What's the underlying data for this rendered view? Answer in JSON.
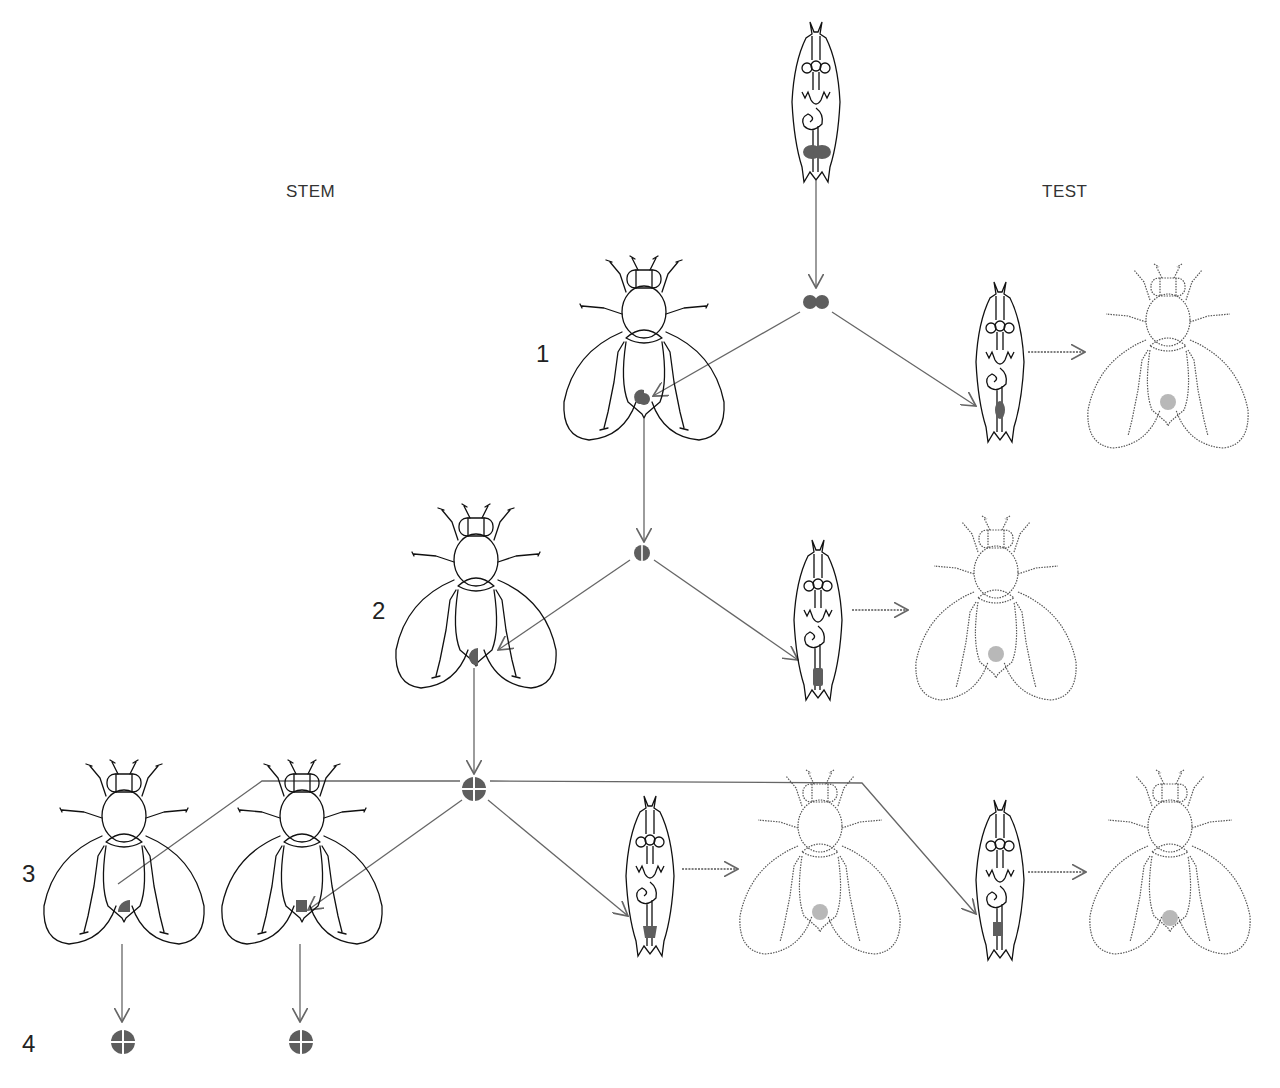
{
  "diagram": {
    "title": "",
    "type": "cell lineage / clonal analysis diagram",
    "column_labels": {
      "stem": "STEM",
      "test": "TEST"
    },
    "stage_labels": [
      "1",
      "2",
      "3",
      "4"
    ],
    "colors": {
      "line": "#666666",
      "outline": "#111111",
      "cell_fill": "#5e5e5e",
      "test_spot": "#b8b8b8",
      "background": "#ffffff"
    },
    "nodes": [
      {
        "id": "source-larva",
        "kind": "larva",
        "note": "donor larva with paired dark cells at posterior"
      },
      {
        "id": "cell-stage1",
        "kind": "cell-cluster",
        "symbol": "two-cells"
      },
      {
        "id": "fly-stage1",
        "kind": "fly",
        "column": "stem",
        "mark": "quarter-round cell in abdomen"
      },
      {
        "id": "test-larva-1",
        "kind": "larva",
        "column": "test"
      },
      {
        "id": "test-fly-1",
        "kind": "fly-dotted",
        "column": "test",
        "mark": "grey spot in abdomen"
      },
      {
        "id": "cell-stage2",
        "kind": "cell-cluster",
        "symbol": "split-circle"
      },
      {
        "id": "fly-stage2",
        "kind": "fly",
        "column": "stem",
        "mark": "half-round cell in abdomen"
      },
      {
        "id": "test-larva-2",
        "kind": "larva",
        "column": "test"
      },
      {
        "id": "test-fly-2",
        "kind": "fly-dotted",
        "column": "test",
        "mark": "grey spot in abdomen"
      },
      {
        "id": "cell-stage3",
        "kind": "cell-cluster",
        "symbol": "quartered-circle"
      },
      {
        "id": "fly-stage3a",
        "kind": "fly",
        "column": "stem",
        "mark": "quarter cell"
      },
      {
        "id": "fly-stage3b",
        "kind": "fly",
        "column": "stem",
        "mark": "quarter cell"
      },
      {
        "id": "test-larva-3a",
        "kind": "larva",
        "column": "test"
      },
      {
        "id": "test-fly-3a",
        "kind": "fly-dotted",
        "column": "test",
        "mark": "grey spot"
      },
      {
        "id": "test-larva-3b",
        "kind": "larva",
        "column": "test"
      },
      {
        "id": "test-fly-3b",
        "kind": "fly-dotted",
        "column": "test",
        "mark": "grey spot"
      },
      {
        "id": "cell-stage4a",
        "kind": "cell-cluster",
        "symbol": "quartered-circle"
      },
      {
        "id": "cell-stage4b",
        "kind": "cell-cluster",
        "symbol": "quartered-circle"
      }
    ],
    "edges": [
      [
        "source-larva",
        "cell-stage1"
      ],
      [
        "cell-stage1",
        "fly-stage1"
      ],
      [
        "cell-stage1",
        "test-larva-1"
      ],
      [
        "test-larva-1",
        "test-fly-1"
      ],
      [
        "fly-stage1",
        "cell-stage2"
      ],
      [
        "cell-stage2",
        "fly-stage2"
      ],
      [
        "cell-stage2",
        "test-larva-2"
      ],
      [
        "test-larva-2",
        "test-fly-2"
      ],
      [
        "fly-stage2",
        "cell-stage3"
      ],
      [
        "cell-stage3",
        "fly-stage3a"
      ],
      [
        "cell-stage3",
        "fly-stage3b"
      ],
      [
        "cell-stage3",
        "test-larva-3a"
      ],
      [
        "cell-stage3",
        "test-larva-3b"
      ],
      [
        "test-larva-3a",
        "test-fly-3a"
      ],
      [
        "test-larva-3b",
        "test-fly-3b"
      ],
      [
        "fly-stage3a",
        "cell-stage4a"
      ],
      [
        "fly-stage3b",
        "cell-stage4b"
      ]
    ]
  }
}
